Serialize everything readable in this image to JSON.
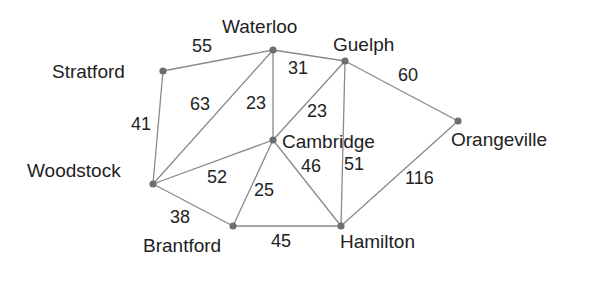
{
  "diagram": {
    "type": "weighted-graph",
    "colors": {
      "edge": "#8a8a8a",
      "node": "#6e6e6e",
      "text": "#222222",
      "background": "#ffffff"
    },
    "nodes": [
      {
        "id": "waterloo",
        "label": "Waterloo",
        "x": 273,
        "y": 50,
        "lx": 222,
        "ly": 33,
        "anchor": "start"
      },
      {
        "id": "guelph",
        "label": "Guelph",
        "x": 345,
        "y": 61,
        "lx": 333,
        "ly": 51,
        "anchor": "start"
      },
      {
        "id": "stratford",
        "label": "Stratford",
        "x": 163,
        "y": 71,
        "lx": 52,
        "ly": 78,
        "anchor": "start"
      },
      {
        "id": "orangeville",
        "label": "Orangeville",
        "x": 458,
        "y": 121,
        "lx": 451,
        "ly": 146,
        "anchor": "start"
      },
      {
        "id": "cambridge",
        "label": "Cambridge",
        "x": 273,
        "y": 140,
        "lx": 282,
        "ly": 148,
        "anchor": "start"
      },
      {
        "id": "woodstock",
        "label": "Woodstock",
        "x": 153,
        "y": 184,
        "lx": 27,
        "ly": 177,
        "anchor": "start"
      },
      {
        "id": "brantford",
        "label": "Brantford",
        "x": 233,
        "y": 226,
        "lx": 143,
        "ly": 252,
        "anchor": "start"
      },
      {
        "id": "hamilton",
        "label": "Hamilton",
        "x": 341,
        "y": 226,
        "lx": 340,
        "ly": 248,
        "anchor": "start"
      }
    ],
    "edges": [
      {
        "from": "stratford",
        "to": "waterloo",
        "weight": "55",
        "wx": 192,
        "wy": 52
      },
      {
        "from": "waterloo",
        "to": "guelph",
        "weight": "31",
        "wx": 288,
        "wy": 74
      },
      {
        "from": "guelph",
        "to": "orangeville",
        "weight": "60",
        "wx": 398,
        "wy": 81
      },
      {
        "from": "stratford",
        "to": "woodstock",
        "weight": "41",
        "wx": 131,
        "wy": 130
      },
      {
        "from": "waterloo",
        "to": "woodstock",
        "weight": "63",
        "wx": 190,
        "wy": 110
      },
      {
        "from": "waterloo",
        "to": "cambridge",
        "weight": "23",
        "wx": 246,
        "wy": 109
      },
      {
        "from": "guelph",
        "to": "cambridge",
        "weight": "23",
        "wx": 307,
        "wy": 117
      },
      {
        "from": "woodstock",
        "to": "cambridge",
        "weight": "52",
        "wx": 207,
        "wy": 183
      },
      {
        "from": "cambridge",
        "to": "brantford",
        "weight": "25",
        "wx": 254,
        "wy": 196
      },
      {
        "from": "cambridge",
        "to": "hamilton",
        "weight": "46",
        "wx": 301,
        "wy": 172
      },
      {
        "from": "guelph",
        "to": "hamilton",
        "weight": "51",
        "wx": 344,
        "wy": 170
      },
      {
        "from": "orangeville",
        "to": "hamilton",
        "weight": "116",
        "wx": 405,
        "wy": 184
      },
      {
        "from": "woodstock",
        "to": "brantford",
        "weight": "38",
        "wx": 170,
        "wy": 223
      },
      {
        "from": "brantford",
        "to": "hamilton",
        "weight": "45",
        "wx": 271,
        "wy": 247
      }
    ]
  }
}
